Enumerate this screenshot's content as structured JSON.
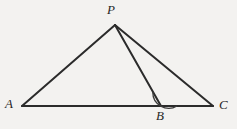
{
  "figure": {
    "background_color": "#f3f2f0",
    "stroke_color": "#2b2b2b",
    "stroke_width": 2,
    "arc_stroke_width": 1.3,
    "labels": {
      "apex": "P",
      "left": "A",
      "foot": "B",
      "right": "C"
    },
    "points": {
      "P": {
        "x": 115,
        "y": 25
      },
      "A": {
        "x": 22,
        "y": 106
      },
      "B": {
        "x": 161,
        "y": 106
      },
      "C": {
        "x": 213,
        "y": 106
      }
    },
    "segments": [
      {
        "name": "segment-PA",
        "from": "P",
        "to": "A"
      },
      {
        "name": "segment-AC",
        "from": "A",
        "to": "C"
      },
      {
        "name": "segment-PC",
        "from": "P",
        "to": "C"
      },
      {
        "name": "segment-PB",
        "from": "P",
        "to": "B"
      }
    ],
    "angle_mark": {
      "name": "angle-PBC",
      "vertex": "B",
      "radius": 16,
      "from_ray": "B-P",
      "to_ray": "B-C",
      "path": "M 153.6 92.0 A 16 16 0 0 0 177 106"
    }
  }
}
